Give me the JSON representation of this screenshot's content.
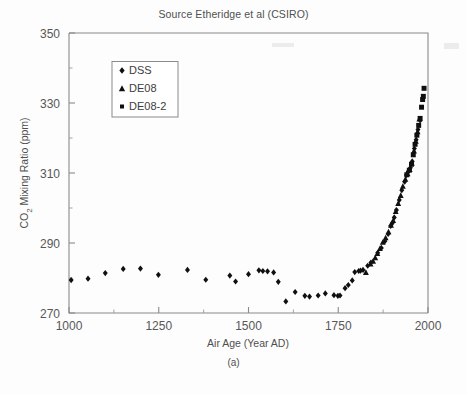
{
  "figure": {
    "title": "Source Etheridge et al (CSIRO)",
    "caption": "(a)"
  },
  "axes": {
    "x": {
      "label": "Air Age (Year AD)",
      "ticks": [
        1000,
        1250,
        1500,
        1750,
        2000
      ],
      "tick_labels": [
        "1000",
        "1250",
        "1500",
        "1750",
        "2000"
      ],
      "min": 1000,
      "max": 2000,
      "minor_step": 125
    },
    "y": {
      "label": "CO2 Mixing Ratio (ppm)",
      "label_prefix": "CO",
      "label_subscript": "2",
      "label_suffix": " Mixing Ratio (ppm)",
      "ticks": [
        270,
        290,
        310,
        330,
        350
      ],
      "tick_labels": [
        "270",
        "290",
        "310",
        "330",
        "350"
      ],
      "min": 270,
      "max": 350,
      "minor_step": 10
    }
  },
  "legend": {
    "position": "top-left",
    "entries": [
      {
        "label": "DSS",
        "marker": "diamond"
      },
      {
        "label": "DE08",
        "marker": "triangle"
      },
      {
        "label": "DE08-2",
        "marker": "square"
      }
    ]
  },
  "colors": {
    "marker": "#101010",
    "axis": "#8a8a8a",
    "text": "#4f4f4f",
    "background": "#fdfdfd"
  },
  "chart_data": {
    "type": "scatter",
    "title": "Source Etheridge et al (CSIRO)",
    "xlabel": "Air Age (Year AD)",
    "ylabel": "CO2 Mixing Ratio (ppm)",
    "xlim": [
      1000,
      2000
    ],
    "ylim": [
      270,
      350
    ],
    "grid": false,
    "legend_position": "top-left",
    "series": [
      {
        "name": "DSS",
        "marker": "diamond",
        "points": [
          [
            1006,
            279.4
          ],
          [
            1053,
            279.8
          ],
          [
            1101,
            281.4
          ],
          [
            1151,
            282.6
          ],
          [
            1199,
            282.7
          ],
          [
            1249,
            280.9
          ],
          [
            1330,
            282.3
          ],
          [
            1381,
            279.5
          ],
          [
            1448,
            280.7
          ],
          [
            1464,
            279.0
          ],
          [
            1500,
            281.1
          ],
          [
            1529,
            282.2
          ],
          [
            1540,
            282.0
          ],
          [
            1553,
            281.9
          ],
          [
            1570,
            281.6
          ],
          [
            1583,
            278.9
          ],
          [
            1604,
            273.3
          ],
          [
            1630,
            276.0
          ],
          [
            1657,
            274.9
          ],
          [
            1670,
            274.7
          ],
          [
            1694,
            275.0
          ],
          [
            1714,
            275.6
          ],
          [
            1738,
            275.1
          ],
          [
            1749,
            274.9
          ],
          [
            1755,
            275.0
          ],
          [
            1769,
            277.1
          ],
          [
            1778,
            278.0
          ],
          [
            1789,
            279.3
          ],
          [
            1796,
            281.7
          ],
          [
            1807,
            282.0
          ],
          [
            1812,
            282.1
          ],
          [
            1819,
            282.3
          ],
          [
            1832,
            283.5
          ],
          [
            1841,
            284.4
          ],
          [
            1860,
            287.2
          ],
          [
            1870,
            288.6
          ],
          [
            1880,
            290.5
          ],
          [
            1889,
            292.6
          ],
          [
            1896,
            294.9
          ],
          [
            1900,
            295.6
          ],
          [
            1906,
            297.3
          ],
          [
            1912,
            299.4
          ],
          [
            1920,
            302.3
          ],
          [
            1927,
            305.1
          ],
          [
            1935,
            307.5
          ],
          [
            1940,
            309.4
          ],
          [
            1945,
            310.4
          ],
          [
            1951,
            311.5
          ],
          [
            1956,
            313.3
          ],
          [
            1962,
            317.0
          ],
          [
            1967,
            319.5
          ],
          [
            1972,
            322.4
          ],
          [
            1978,
            325.0
          ]
        ]
      },
      {
        "name": "DE08",
        "marker": "triangle",
        "points": [
          [
            1827,
            281.6
          ],
          [
            1840,
            284.0
          ],
          [
            1847,
            284.8
          ],
          [
            1853,
            285.8
          ],
          [
            1859,
            287.0
          ],
          [
            1866,
            288.4
          ],
          [
            1874,
            290.2
          ],
          [
            1882,
            291.5
          ],
          [
            1890,
            293.2
          ],
          [
            1897,
            295.1
          ],
          [
            1903,
            296.4
          ],
          [
            1910,
            299.0
          ],
          [
            1917,
            301.3
          ],
          [
            1924,
            303.6
          ],
          [
            1930,
            306.2
          ],
          [
            1937,
            308.2
          ],
          [
            1943,
            309.8
          ],
          [
            1949,
            311.0
          ],
          [
            1955,
            312.8
          ],
          [
            1961,
            316.3
          ],
          [
            1966,
            319.1
          ],
          [
            1971,
            321.8
          ],
          [
            1976,
            325.4
          ]
        ]
      },
      {
        "name": "DE08-2",
        "marker": "square",
        "points": [
          [
            1941,
            309.5
          ],
          [
            1948,
            310.8
          ],
          [
            1954,
            312.5
          ],
          [
            1959,
            315.2
          ],
          [
            1964,
            318.2
          ],
          [
            1969,
            320.8
          ],
          [
            1974,
            323.6
          ],
          [
            1978,
            325.6
          ],
          [
            1982,
            328.8
          ],
          [
            1985,
            331.0
          ],
          [
            1987,
            331.9
          ],
          [
            1989,
            334.2
          ]
        ]
      }
    ]
  }
}
